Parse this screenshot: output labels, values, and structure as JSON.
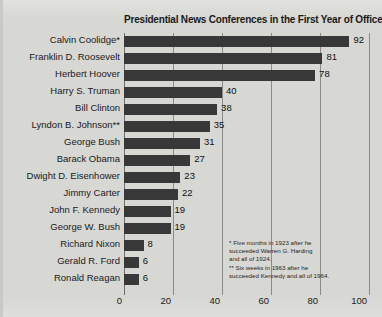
{
  "chart_data": {
    "type": "bar",
    "orientation": "horizontal",
    "title": "Presidential News Conferences in the First Year of Office",
    "xlabel": "",
    "ylabel": "",
    "xlim": [
      0,
      100
    ],
    "xticks": [
      0,
      20,
      40,
      60,
      80,
      100
    ],
    "grid": true,
    "legend": false,
    "bar_color": "#383838",
    "background_color": "#d7d7d4",
    "categories": [
      "Calvin Coolidge*",
      "Franklin D. Roosevelt",
      "Herbert Hoover",
      "Harry S. Truman",
      "Bill Clinton",
      "Lyndon B. Johnson**",
      "George Bush",
      "Barack Obama",
      "Dwight D. Eisenhower",
      "Jimmy Carter",
      "John F. Kennedy",
      "George W. Bush",
      "Richard Nixon",
      "Gerald R. Ford",
      "Ronald Reagan"
    ],
    "values": [
      92,
      81,
      78,
      40,
      38,
      35,
      31,
      27,
      23,
      22,
      19,
      19,
      8,
      6,
      6
    ],
    "annotations": [
      "* Five months in 1923 after he",
      "succeeded Warren G. Harding",
      "and all of 1924.",
      "** Six weeks in 1963 after he",
      "succeeded Kennedy and all of 1964."
    ]
  }
}
